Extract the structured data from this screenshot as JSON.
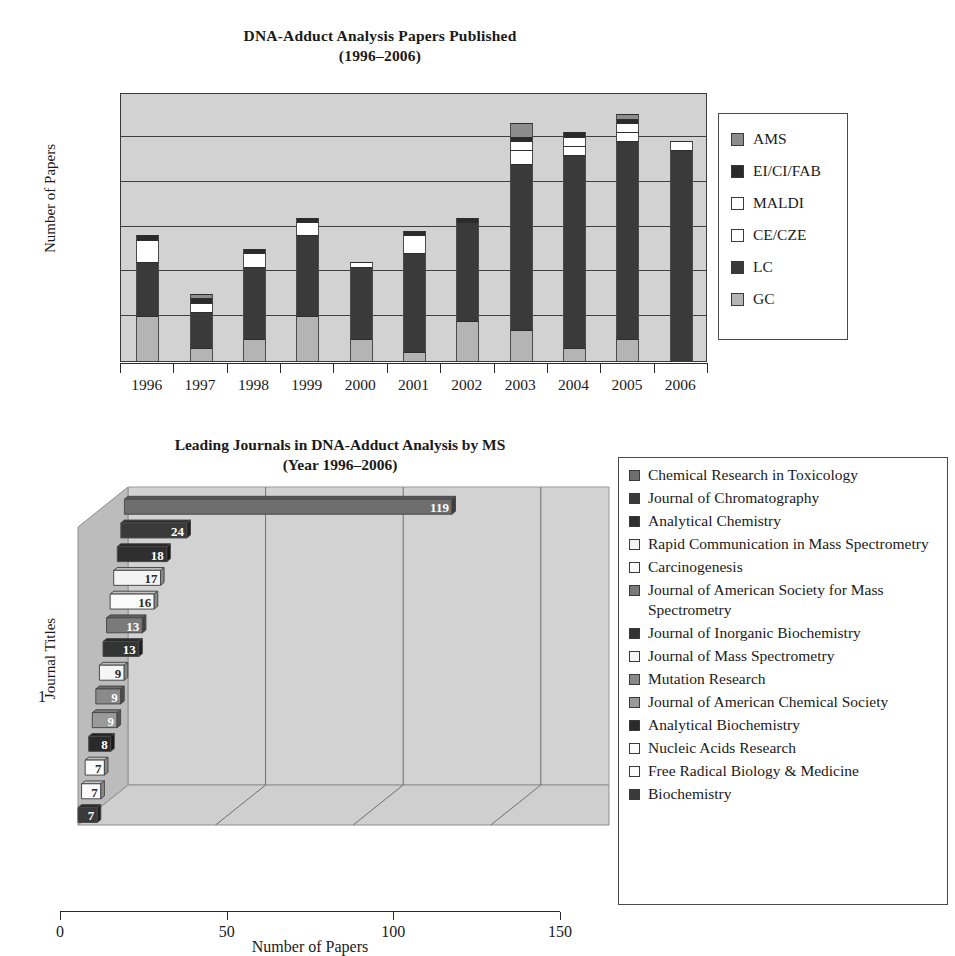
{
  "chart_data": [
    {
      "type": "bar",
      "subtype": "stacked-column",
      "title": "DNA-Adduct Analysis Papers Published",
      "subtitle": "(1996–2006)",
      "xlabel": "",
      "ylabel": "Number of Papers",
      "ylim": [
        0,
        60
      ],
      "yticks": [
        0,
        10,
        20,
        30,
        40,
        50,
        60
      ],
      "grid": true,
      "legend_position": "right",
      "categories": [
        "1996",
        "1997",
        "1998",
        "1999",
        "2000",
        "2001",
        "2002",
        "2003",
        "2004",
        "2005",
        "2006"
      ],
      "series": [
        {
          "name": "GC",
          "color": "#b4b4b4",
          "values": [
            10,
            3,
            5,
            10,
            5,
            2,
            9,
            7,
            3,
            5,
            0
          ]
        },
        {
          "name": "LC",
          "color": "#3a3a3a",
          "values": [
            12,
            8,
            16,
            18,
            16,
            22,
            22,
            37,
            43,
            44,
            47
          ]
        },
        {
          "name": "CE/CZE",
          "color": "#ffffff",
          "values": [
            5,
            2,
            3,
            3,
            1,
            4,
            0,
            3,
            2,
            2,
            2
          ]
        },
        {
          "name": "MALDI",
          "color": "#ffffff",
          "values": [
            0,
            0,
            0,
            0,
            0,
            0,
            0,
            2,
            2,
            2,
            0
          ]
        },
        {
          "name": "EI/CI/FAB",
          "color": "#2a2a2a",
          "values": [
            1,
            1,
            1,
            1,
            0,
            1,
            1,
            1,
            1,
            1,
            0
          ]
        },
        {
          "name": "AMS",
          "color": "#8c8c8c",
          "values": [
            0,
            1,
            0,
            0,
            0,
            0,
            0,
            3,
            0,
            1,
            0
          ]
        }
      ],
      "totals": [
        28,
        15,
        25,
        32,
        22,
        29,
        32,
        53,
        51,
        55,
        49
      ],
      "legend": [
        {
          "label": "AMS",
          "color": "#8c8c8c"
        },
        {
          "label": "EI/CI/FAB",
          "color": "#2a2a2a"
        },
        {
          "label": "MALDI",
          "color": "#ffffff"
        },
        {
          "label": "CE/CZE",
          "color": "#ffffff"
        },
        {
          "label": "LC",
          "color": "#3a3a3a"
        },
        {
          "label": "GC",
          "color": "#b4b4b4"
        }
      ]
    },
    {
      "type": "bar",
      "subtype": "horizontal-3d",
      "title": "Leading Journals in DNA-Adduct Analysis by MS",
      "subtitle": "(Year 1996–2006)",
      "xlabel": "Number of Papers",
      "ylabel": "Journal Titles",
      "xlim": [
        0,
        150
      ],
      "xticks": [
        0,
        50,
        100,
        150
      ],
      "ytick_labels": [
        "1"
      ],
      "grid": true,
      "legend_position": "right",
      "categories": [
        "Chemical Research in Toxicology",
        "Journal of Chromatography",
        "Analytical Chemistry",
        "Rapid Communication in Mass Spectrometry",
        "Carcinogenesis",
        "Journal of American Society for Mass Spectrometry",
        "Journal of Inorganic Biochemistry",
        "Journal of Mass Spectrometry",
        "Mutation Research",
        "Journal of American Chemical Society",
        "Analytical Biochemistry",
        "Nucleic Acids Research",
        "Free Radical Biology & Medicine",
        "Biochemistry"
      ],
      "values": [
        119,
        24,
        18,
        17,
        16,
        13,
        13,
        9,
        9,
        9,
        8,
        7,
        7,
        7
      ],
      "value_labels": [
        "119",
        "24",
        "18",
        "17",
        "16",
        "13",
        "13",
        "9",
        "9",
        "9",
        "8",
        "7",
        "7",
        "7"
      ],
      "colors": [
        "#6e6e6e",
        "#3a3a3a",
        "#2f2f2f",
        "#f4f4f4",
        "#fbfbfb",
        "#7a7a7a",
        "#333333",
        "#f6f6f6",
        "#8a8a8a",
        "#9a9a9a",
        "#2a2a2a",
        "#fbfbfb",
        "#fbfbfb",
        "#3a3a3a"
      ],
      "legend": [
        {
          "label": "Chemical Research in Toxicology",
          "color": "#6e6e6e"
        },
        {
          "label": "Journal of Chromatography",
          "color": "#3a3a3a"
        },
        {
          "label": "Analytical Chemistry",
          "color": "#2f2f2f"
        },
        {
          "label": "Rapid Communication in Mass Spectrometry",
          "color": "#f4f4f4"
        },
        {
          "label": "Carcinogenesis",
          "color": "#fbfbfb"
        },
        {
          "label": "Journal of American Society for Mass Spectrometry",
          "color": "#7a7a7a"
        },
        {
          "label": "Journal of Inorganic Biochemistry",
          "color": "#333333"
        },
        {
          "label": "Journal of Mass Spectrometry",
          "color": "#f6f6f6"
        },
        {
          "label": "Mutation Research",
          "color": "#8a8a8a"
        },
        {
          "label": "Journal of American Chemical Society",
          "color": "#9a9a9a"
        },
        {
          "label": "Analytical Biochemistry",
          "color": "#2a2a2a"
        },
        {
          "label": "Nucleic Acids Research",
          "color": "#fbfbfb"
        },
        {
          "label": "Free Radical Biology & Medicine",
          "color": "#fbfbfb"
        },
        {
          "label": "Biochemistry",
          "color": "#3a3a3a"
        }
      ]
    }
  ],
  "chart1": {
    "title_line1": "DNA-Adduct Analysis Papers Published",
    "title_line2": "(1996–2006)",
    "ylabel": "Number of Papers"
  },
  "chart2": {
    "title_line1": "Leading Journals in DNA-Adduct Analysis by MS",
    "title_line2": "(Year 1996–2006)",
    "ylabel": "Journal Titles",
    "xlabel": "Number of Papers",
    "ytick": "1"
  }
}
